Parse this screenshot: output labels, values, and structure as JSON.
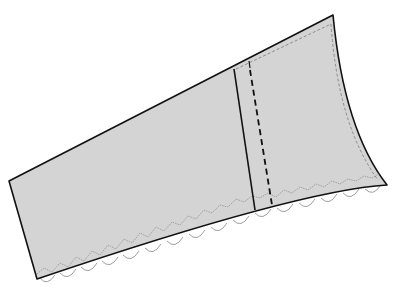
{
  "diagram": {
    "colors": {
      "fabric_fill": "#d4d4d4",
      "outline": "#111111",
      "stitch": "#7a7a7a",
      "scallop": "#888888",
      "background": "#ffffff"
    },
    "parts": [
      {
        "name": "fabric-panel",
        "description": "trapezoidal fabric piece"
      },
      {
        "name": "fold-line",
        "description": "solid vertical line"
      },
      {
        "name": "seam-line",
        "description": "bold dashed vertical line"
      },
      {
        "name": "topstitch",
        "description": "fine dashed stitching along top and right edges"
      },
      {
        "name": "zigzag-stitch",
        "description": "zigzag stitching along bottom edge"
      },
      {
        "name": "scalloped-edge",
        "description": "scallop trim along bottom edge"
      }
    ]
  }
}
